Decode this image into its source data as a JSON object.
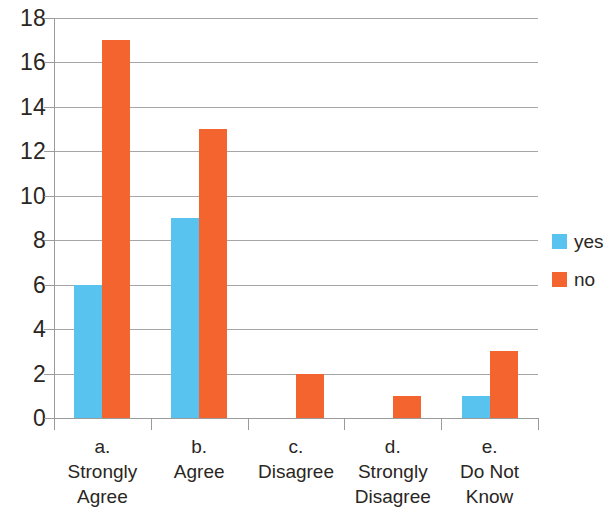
{
  "chart_data": {
    "type": "bar",
    "title": "",
    "xlabel": "",
    "ylabel": "",
    "ylim": [
      0,
      18
    ],
    "ytick_step": 2,
    "yticks": [
      0,
      2,
      4,
      6,
      8,
      10,
      12,
      14,
      16,
      18
    ],
    "grid": true,
    "legend_position": "right",
    "categories": [
      "a.\nStrongly\nAgree",
      "b.\nAgree",
      "c.\nDisagree",
      "d.\nStrongly\nDisagree",
      "e.\nDo Not\nKnow"
    ],
    "category_lines": [
      [
        "a.",
        "Strongly",
        "Agree"
      ],
      [
        "b.",
        "Agree"
      ],
      [
        "c.",
        "Disagree"
      ],
      [
        "d.",
        "Strongly",
        "Disagree"
      ],
      [
        "e.",
        "Do Not",
        "Know"
      ]
    ],
    "series": [
      {
        "name": "yes",
        "color": "#59c3ef",
        "values": [
          6,
          9,
          0,
          0,
          1
        ]
      },
      {
        "name": "no",
        "color": "#f4642e",
        "values": [
          17,
          13,
          2,
          1,
          3
        ]
      }
    ]
  },
  "legend": {
    "items": [
      {
        "label": "yes",
        "color": "#59c3ef"
      },
      {
        "label": "no",
        "color": "#f4642e"
      }
    ]
  },
  "axis": {
    "y_tick_labels": [
      "18",
      "16",
      "14",
      "12",
      "10",
      "8",
      "6",
      "4",
      "2",
      "0"
    ]
  }
}
